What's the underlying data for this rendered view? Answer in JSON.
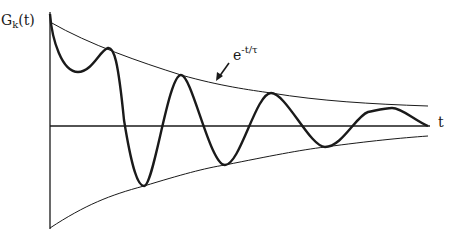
{
  "diagram": {
    "type": "damped-oscillation",
    "y_label": {
      "base": "G",
      "subscript": "k",
      "arg": "(t)"
    },
    "x_label": "t",
    "envelope_label": {
      "base": "e",
      "exponent": "-t/τ"
    },
    "colors": {
      "line": "#1a1a1a",
      "background": "#ffffff"
    }
  }
}
